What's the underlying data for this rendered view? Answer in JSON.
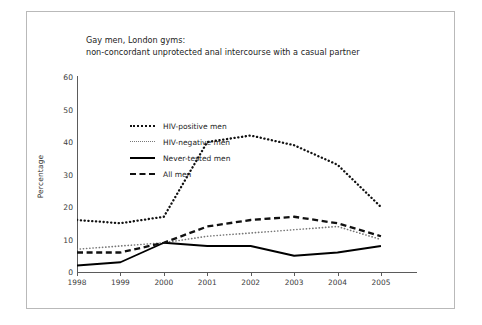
{
  "figure": {
    "title_line1": "Gay men, London gyms:",
    "title_line2": "non-concordant unprotected anal intercourse with a casual partner"
  },
  "chart_data": {
    "type": "line",
    "title": "Gay men, London gyms: non-concordant unprotected anal intercourse with a casual partner",
    "xlabel": "",
    "ylabel": "Percentage",
    "categories": [
      "1998",
      "1999",
      "2000",
      "2001",
      "2002",
      "2003",
      "2004",
      "2005"
    ],
    "x": [
      1998,
      1999,
      2000,
      2001,
      2002,
      2003,
      2004,
      2005
    ],
    "ylim": [
      0,
      60
    ],
    "yticks": [
      0,
      10,
      20,
      30,
      40,
      50,
      60
    ],
    "xlim": [
      1998,
      2005.6
    ],
    "grid": false,
    "legend_position": "upper-left-inside",
    "series": [
      {
        "name": "HIV-positive men",
        "style": "dotted-thick",
        "color": "#111111",
        "values": [
          16,
          15,
          17,
          40,
          42,
          39,
          33,
          20
        ]
      },
      {
        "name": "HIV-negative men",
        "style": "dotted-fine",
        "color": "#777777",
        "values": [
          7,
          8,
          9,
          11,
          12,
          13,
          14,
          10
        ]
      },
      {
        "name": "Never-tested men",
        "style": "solid",
        "color": "#000000",
        "values": [
          2,
          3,
          9,
          8,
          8,
          5,
          6,
          8
        ]
      },
      {
        "name": "All men",
        "style": "dashed",
        "color": "#111111",
        "values": [
          6,
          6,
          9,
          14,
          16,
          17,
          15,
          11
        ]
      }
    ]
  },
  "axis": {
    "ytick_labels": [
      "60",
      "50",
      "40",
      "30",
      "20",
      "10",
      "0"
    ],
    "xtick_labels": [
      "1998",
      "1999",
      "2000",
      "2001",
      "2002",
      "2003",
      "2004",
      "2005"
    ],
    "ytitle": "Percentage"
  },
  "legend": {
    "items": [
      {
        "label": "HIV-positive men",
        "style": "dotted-thick"
      },
      {
        "label": "HIV-negative men",
        "style": "dotted-fine"
      },
      {
        "label": "Never-tested men",
        "style": "solid"
      },
      {
        "label": "All men",
        "style": "dashed"
      }
    ]
  }
}
